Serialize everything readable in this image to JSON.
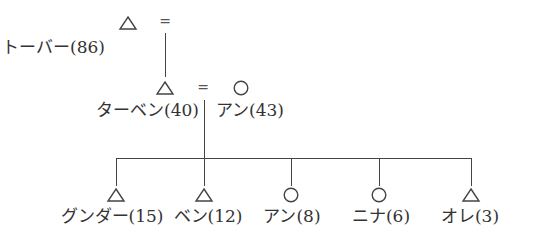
{
  "diagram": {
    "type": "kinship-chart",
    "legend_symbols": {
      "male": "triangle",
      "female": "circle",
      "marriage": "="
    },
    "generation1": {
      "person": {
        "symbol": "triangle",
        "label": "トーバー(86)",
        "name": "トーバー",
        "age": 86
      },
      "marriage_sign": "="
    },
    "generation2": {
      "husband": {
        "symbol": "triangle",
        "label": "ターベン(40)",
        "name": "ターベン",
        "age": 40
      },
      "marriage_sign": "=",
      "wife": {
        "symbol": "circle",
        "label": "アン(43)",
        "name": "アン",
        "age": 43
      }
    },
    "children": [
      {
        "symbol": "triangle",
        "label": "グンダー(15)",
        "name": "グンダー",
        "age": 15
      },
      {
        "symbol": "triangle",
        "label": "ベン(12)",
        "name": "ベン",
        "age": 12
      },
      {
        "symbol": "circle",
        "label": "アン(8)",
        "name": "アン",
        "age": 8
      },
      {
        "symbol": "circle",
        "label": "ニナ(6)",
        "name": "ニナ",
        "age": 6
      },
      {
        "symbol": "triangle",
        "label": "オレ(3)",
        "name": "オレ",
        "age": 3
      }
    ]
  }
}
